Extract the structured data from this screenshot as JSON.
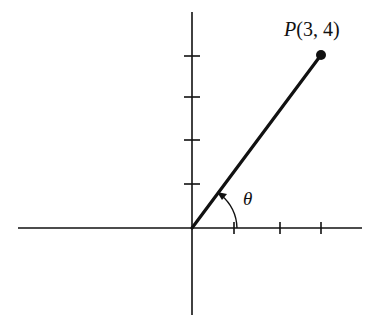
{
  "diagram": {
    "type": "coordinate-plane-angle",
    "point_label": {
      "name": "P",
      "coords": "(3, 4)"
    },
    "point": {
      "x": 3,
      "y": 4
    },
    "angle_label": "θ",
    "x_ticks": [
      1,
      2,
      3
    ],
    "y_ticks": [
      1,
      2,
      3,
      4
    ],
    "colors": {
      "stroke": "#111111",
      "background": "#ffffff"
    }
  }
}
